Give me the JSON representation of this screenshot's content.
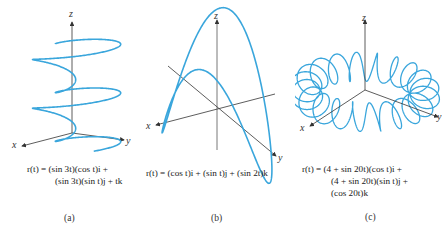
{
  "figure": {
    "curve_color": "#3aa6dc",
    "axis_color": "#333333",
    "panels": [
      {
        "id": "a",
        "label": "(a)",
        "equation_lines": [
          "r(t) = (sin 3t)(cos t)i +",
          "(sin 3t)(sin t)j + tk"
        ],
        "axes": {
          "x": "x",
          "y": "y",
          "z": "z"
        },
        "curve": "sin(3t)cos(t), sin(3t)sin(t), t"
      },
      {
        "id": "b",
        "label": "(b)",
        "equation_lines": [
          "r(t) = (cos t)i + (sin t)j + (sin 2t)k"
        ],
        "axes": {
          "x": "x",
          "y": "y",
          "z": "z"
        },
        "curve": "cos(t), sin(t), sin(2t)"
      },
      {
        "id": "c",
        "label": "(c)",
        "equation_lines": [
          "r(t) = (4 + sin 20t)(cos t)i +",
          "(4 + sin 20t)(sin t)j +",
          "(cos 20t)k"
        ],
        "axes": {
          "x": "x",
          "y": "y",
          "z": "z"
        },
        "curve": "(4+sin(20t))cos(t), (4+sin(20t))sin(t), cos(20t)"
      }
    ]
  }
}
